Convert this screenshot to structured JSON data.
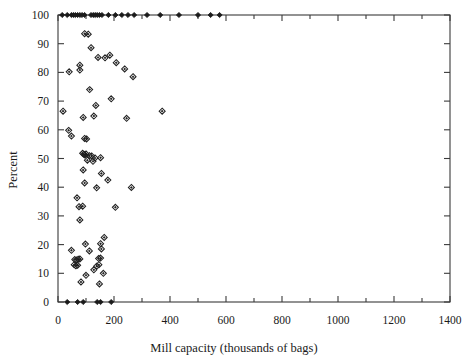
{
  "chart_data": {
    "type": "scatter",
    "title": "",
    "xlabel": "Mill capacity (thousands of bags)",
    "ylabel": "Percent",
    "xlim": [
      0,
      1400
    ],
    "ylim": [
      0,
      100
    ],
    "xticks": [
      0,
      200,
      400,
      600,
      800,
      1000,
      1200,
      1400
    ],
    "xtick_labels": [
      "0",
      "200",
      "400",
      "600",
      "800",
      "1000",
      "1200",
      "1400"
    ],
    "xminor_step": 100,
    "yticks": [
      0,
      10,
      20,
      30,
      40,
      50,
      60,
      70,
      80,
      90,
      100
    ],
    "ytick_labels": [
      "0",
      "10",
      "20",
      "30",
      "40",
      "50",
      "60",
      "70",
      "80",
      "90",
      "100"
    ],
    "grid": false,
    "legend": null,
    "marker_open": "diamond",
    "marker_filled": "filled-diamond",
    "series": [
      {
        "name": "Cumulative ceiling (100%)",
        "marker": "filled-diamond",
        "points": [
          [
            15,
            100
          ],
          [
            33,
            100
          ],
          [
            48,
            100
          ],
          [
            55,
            100
          ],
          [
            62,
            100
          ],
          [
            70,
            100
          ],
          [
            78,
            100
          ],
          [
            86,
            100
          ],
          [
            95,
            100
          ],
          [
            118,
            100
          ],
          [
            126,
            100
          ],
          [
            133,
            100
          ],
          [
            140,
            100
          ],
          [
            148,
            100
          ],
          [
            157,
            100
          ],
          [
            180,
            100
          ],
          [
            205,
            100
          ],
          [
            228,
            100
          ],
          [
            250,
            100
          ],
          [
            272,
            100
          ],
          [
            318,
            100
          ],
          [
            365,
            100
          ],
          [
            432,
            100
          ],
          [
            500,
            100
          ],
          [
            545,
            100
          ],
          [
            577,
            100
          ]
        ]
      },
      {
        "name": "Baseline (0%)",
        "marker": "filled-diamond",
        "points": [
          [
            33,
            0
          ],
          [
            70,
            0
          ],
          [
            90,
            0
          ],
          [
            140,
            0
          ],
          [
            152,
            0
          ],
          [
            190,
            0
          ]
        ]
      },
      {
        "name": "Mill observations",
        "marker": "diamond",
        "points": [
          [
            95,
            93.5
          ],
          [
            108,
            93.3
          ],
          [
            118,
            88.6
          ],
          [
            78,
            82.5
          ],
          [
            78,
            80.8
          ],
          [
            40,
            80.2
          ],
          [
            143,
            85.2
          ],
          [
            168,
            85.1
          ],
          [
            185,
            86.0
          ],
          [
            208,
            83.4
          ],
          [
            238,
            81.2
          ],
          [
            268,
            78.5
          ],
          [
            113,
            74.0
          ],
          [
            135,
            68.5
          ],
          [
            190,
            70.8
          ],
          [
            18,
            66.5
          ],
          [
            128,
            64.8
          ],
          [
            90,
            64.3
          ],
          [
            245,
            64.0
          ],
          [
            372,
            66.5
          ],
          [
            38,
            59.8
          ],
          [
            48,
            57.8
          ],
          [
            95,
            57.0
          ],
          [
            102,
            56.8
          ],
          [
            88,
            51.8
          ],
          [
            92,
            51.5
          ],
          [
            96,
            51.2
          ],
          [
            100,
            51.6
          ],
          [
            112,
            51.0
          ],
          [
            120,
            50.9
          ],
          [
            132,
            50.2
          ],
          [
            152,
            50.3
          ],
          [
            105,
            49.4
          ],
          [
            125,
            49.0
          ],
          [
            90,
            46.0
          ],
          [
            155,
            44.8
          ],
          [
            95,
            41.5
          ],
          [
            138,
            39.8
          ],
          [
            178,
            42.5
          ],
          [
            262,
            39.9
          ],
          [
            68,
            36.3
          ],
          [
            75,
            33.2
          ],
          [
            88,
            33.4
          ],
          [
            205,
            33.0
          ],
          [
            78,
            28.6
          ],
          [
            165,
            22.5
          ],
          [
            152,
            20.3
          ],
          [
            98,
            20.2
          ],
          [
            48,
            18.0
          ],
          [
            155,
            18.5
          ],
          [
            112,
            17.8
          ],
          [
            60,
            14.8
          ],
          [
            66,
            14.6
          ],
          [
            72,
            14.9
          ],
          [
            78,
            15.0
          ],
          [
            145,
            15.2
          ],
          [
            152,
            15.3
          ],
          [
            58,
            13.0
          ],
          [
            64,
            12.6
          ],
          [
            70,
            12.8
          ],
          [
            138,
            12.5
          ],
          [
            146,
            13.0
          ],
          [
            128,
            11.2
          ],
          [
            162,
            10.0
          ],
          [
            100,
            9.3
          ],
          [
            82,
            7.0
          ],
          [
            148,
            6.3
          ]
        ]
      }
    ]
  },
  "axes": {
    "ylabel": "Percent",
    "xlabel": "Mill capacity (thousands of bags)"
  }
}
